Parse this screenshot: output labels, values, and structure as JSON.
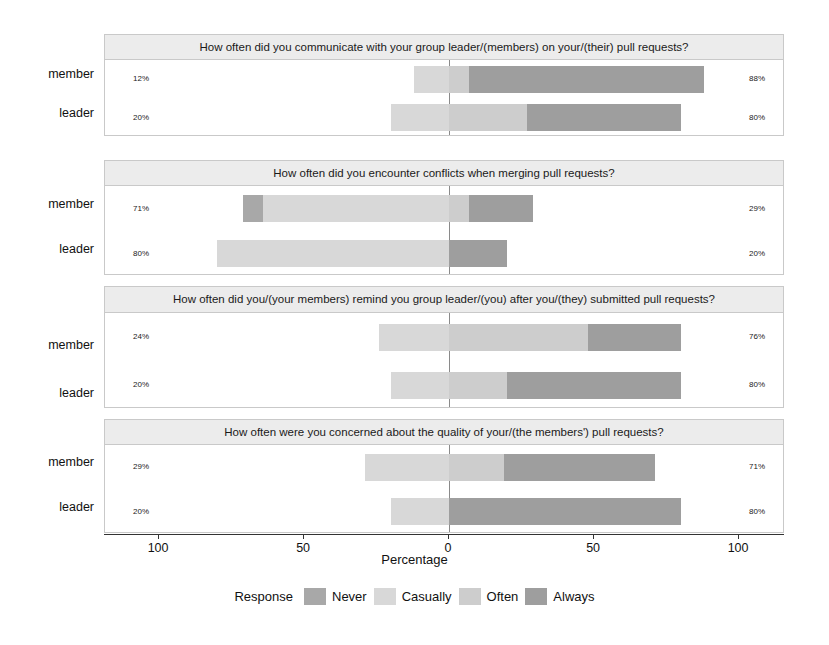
{
  "chart_data": {
    "type": "bar",
    "subtype": "diverging-stacked-likert",
    "title": "",
    "xlabel": "Percentage",
    "ylabel": "",
    "xlim": [
      -110,
      110
    ],
    "xticks": [
      -100,
      -50,
      0,
      50,
      100
    ],
    "xticklabels": [
      "100",
      "50",
      "0",
      "50",
      "100"
    ],
    "grid": false,
    "legend": {
      "title": "Response",
      "position": "bottom",
      "entries": [
        {
          "name": "Never",
          "color": "#a8a8a8"
        },
        {
          "name": "Casually",
          "color": "#d8d8d8"
        },
        {
          "name": "Often",
          "color": "#cdcdcd"
        },
        {
          "name": "Always",
          "color": "#9e9e9e"
        }
      ]
    },
    "categories": [
      "member",
      "leader"
    ],
    "panels": [
      {
        "title": "How often did you communicate with your group leader/(members) on your/(their) pull requests?",
        "rows": [
          {
            "label": "member",
            "left_total_label": "12%",
            "right_total_label": "88%",
            "segments": [
              {
                "response": "Never",
                "value": 0,
                "side": "left"
              },
              {
                "response": "Casually",
                "value": 12,
                "side": "left"
              },
              {
                "response": "Often",
                "value": 7,
                "side": "right"
              },
              {
                "response": "Always",
                "value": 81,
                "side": "right"
              }
            ]
          },
          {
            "label": "leader",
            "left_total_label": "20%",
            "right_total_label": "80%",
            "segments": [
              {
                "response": "Never",
                "value": 0,
                "side": "left"
              },
              {
                "response": "Casually",
                "value": 20,
                "side": "left"
              },
              {
                "response": "Often",
                "value": 27,
                "side": "right"
              },
              {
                "response": "Always",
                "value": 53,
                "side": "right"
              }
            ]
          }
        ]
      },
      {
        "title": "How often did you encounter conflicts when merging pull requests?",
        "rows": [
          {
            "label": "member",
            "left_total_label": "71%",
            "right_total_label": "29%",
            "segments": [
              {
                "response": "Never",
                "value": 7,
                "side": "left"
              },
              {
                "response": "Casually",
                "value": 64,
                "side": "left"
              },
              {
                "response": "Often",
                "value": 7,
                "side": "right"
              },
              {
                "response": "Always",
                "value": 22,
                "side": "right"
              }
            ]
          },
          {
            "label": "leader",
            "left_total_label": "80%",
            "right_total_label": "20%",
            "segments": [
              {
                "response": "Never",
                "value": 0,
                "side": "left"
              },
              {
                "response": "Casually",
                "value": 80,
                "side": "left"
              },
              {
                "response": "Often",
                "value": 0,
                "side": "right"
              },
              {
                "response": "Always",
                "value": 20,
                "side": "right"
              }
            ]
          }
        ]
      },
      {
        "title": "How often did you/(your members) remind you group leader/(you) after you/(they) submitted pull requests?",
        "rows": [
          {
            "label": "member",
            "left_total_label": "24%",
            "right_total_label": "76%",
            "segments": [
              {
                "response": "Never",
                "value": 0,
                "side": "left"
              },
              {
                "response": "Casually",
                "value": 24,
                "side": "left"
              },
              {
                "response": "Often",
                "value": 48,
                "side": "right"
              },
              {
                "response": "Always",
                "value": 32,
                "side": "right"
              }
            ]
          },
          {
            "label": "leader",
            "left_total_label": "20%",
            "right_total_label": "80%",
            "segments": [
              {
                "response": "Never",
                "value": 0,
                "side": "left"
              },
              {
                "response": "Casually",
                "value": 20,
                "side": "left"
              },
              {
                "response": "Often",
                "value": 20,
                "side": "right"
              },
              {
                "response": "Always",
                "value": 60,
                "side": "right"
              }
            ]
          }
        ]
      },
      {
        "title": "How often were you concerned about the quality of your/(the members') pull requests?",
        "rows": [
          {
            "label": "member",
            "left_total_label": "29%",
            "right_total_label": "71%",
            "segments": [
              {
                "response": "Never",
                "value": 0,
                "side": "left"
              },
              {
                "response": "Casually",
                "value": 29,
                "side": "left"
              },
              {
                "response": "Often",
                "value": 19,
                "side": "right"
              },
              {
                "response": "Always",
                "value": 52,
                "side": "right"
              }
            ]
          },
          {
            "label": "leader",
            "left_total_label": "20%",
            "right_total_label": "80%",
            "segments": [
              {
                "response": "Never",
                "value": 0,
                "side": "left"
              },
              {
                "response": "Casually",
                "value": 20,
                "side": "left"
              },
              {
                "response": "Often",
                "value": 0,
                "side": "right"
              },
              {
                "response": "Always",
                "value": 80,
                "side": "right"
              }
            ]
          }
        ]
      }
    ]
  },
  "layout": {
    "panel_tops": [
      34,
      160,
      286,
      419
    ],
    "panel_title_heights": [
      22,
      22,
      36,
      22
    ],
    "panel_body_heights": [
      77,
      90,
      96,
      89
    ],
    "zero_pct": 50.6,
    "px_per_pct": 2.9
  }
}
